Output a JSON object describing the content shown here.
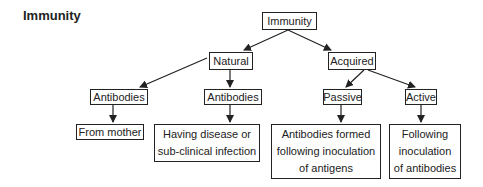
{
  "title": "Immunity",
  "nodes": {
    "root": "Immunity",
    "natural": "Natural",
    "acquired": "Acquired",
    "antibodies_left": "Antibodies",
    "antibodies_right": "Antibodies",
    "passive": "Passive",
    "active": "Active",
    "from_mother": "From mother",
    "having_disease": "Having disease or sub-clinical infection",
    "antibodies_formed": "Antibodies formed following inoculation of antigens",
    "following_inoculation": "Following inoculation of antibodies"
  },
  "lines": {
    "having_disease": [
      "Having disease or",
      "sub-clinical infection"
    ],
    "antibodies_formed": [
      "Antibodies formed",
      "following inoculation",
      "of antigens"
    ],
    "following_inoculation": [
      "Following",
      "inoculation",
      "of antibodies"
    ]
  },
  "colors": {
    "stroke": "#222222",
    "background": "#ffffff"
  }
}
